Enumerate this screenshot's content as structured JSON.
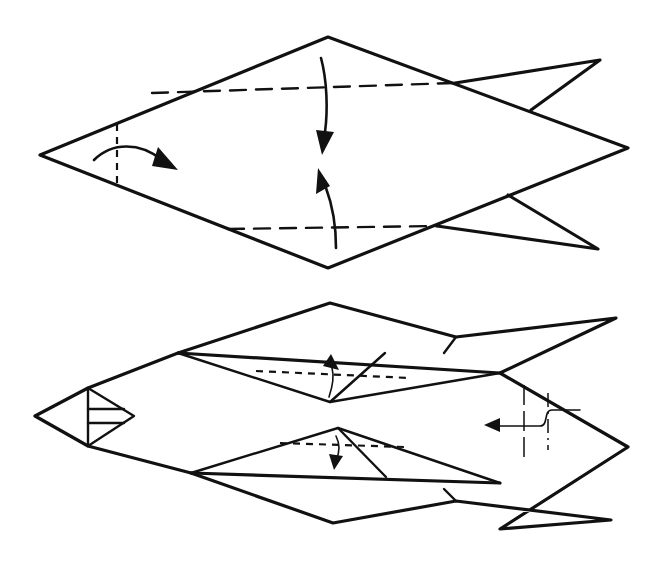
{
  "diagram": {
    "type": "origami-instruction",
    "steps": [
      {
        "name": "step-1",
        "description": "Diamond base with two tail fins; valley fold the nose tip in, fold upper and lower edges to the center line",
        "symbols": [
          "valley-fold-line",
          "fold-arrow-down",
          "fold-arrow-up",
          "fold-arrow-right"
        ]
      },
      {
        "name": "step-2",
        "description": "Folded body with fins; fold flaps, mountain/valley fold the tail region and push in (sink)",
        "symbols": [
          "valley-fold-line",
          "mountain-fold-line",
          "fold-arrow-up",
          "fold-arrow-down",
          "push-in-arrow"
        ]
      }
    ],
    "colors": {
      "line": "#111111",
      "background": "#ffffff"
    }
  }
}
